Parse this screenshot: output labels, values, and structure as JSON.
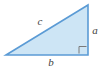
{
  "figure": {
    "kind": "right-triangle-diagram",
    "canvas": {
      "width": 107,
      "height": 70,
      "background": "#ffffff"
    },
    "triangle": {
      "fill_color": "#cde5f5",
      "stroke_color": "#5b9bd5",
      "stroke_width": 1.6,
      "vertices": {
        "left": {
          "x": 6,
          "y": 55
        },
        "top_right": {
          "x": 88,
          "y": 5
        },
        "bottom_right": {
          "x": 88,
          "y": 55
        }
      }
    },
    "right_angle_marker": {
      "corner": "bottom-right",
      "size": 8,
      "x": 79,
      "y": 46,
      "stroke_color": "#7a7a7a",
      "stroke_width": 1
    },
    "labels": {
      "hypotenuse": {
        "text": "c",
        "x": 40,
        "y": 22,
        "color": "#3f3f3f"
      },
      "vertical_leg": {
        "text": "a",
        "x": 95,
        "y": 31,
        "color": "#3f3f3f"
      },
      "base_leg": {
        "text": "b",
        "x": 51,
        "y": 63,
        "color": "#3f3f3f"
      }
    }
  }
}
